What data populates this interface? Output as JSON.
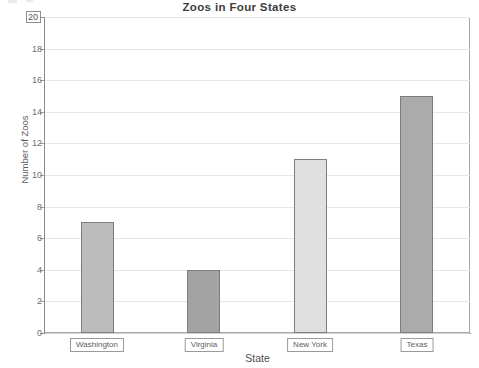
{
  "chart_data": {
    "type": "bar",
    "title": "Zoos in Four States",
    "xlabel": "State",
    "ylabel": "Number of Zoos",
    "categories": [
      "Washington",
      "Virginia",
      "New York",
      "Texas"
    ],
    "values": [
      7,
      4,
      11,
      15
    ],
    "ylim": [
      0,
      20
    ],
    "ytick_step": 2,
    "yticks": [
      0,
      2,
      4,
      6,
      8,
      10,
      12,
      14,
      16,
      18,
      20
    ],
    "ytick_labels": [
      "0",
      "2",
      "4",
      "6",
      "8",
      "10",
      "12",
      "14",
      "16",
      "18",
      "20"
    ],
    "xtick_labels_boxed": true,
    "ytick_top_label_boxed": true,
    "grid": "horizontal",
    "legend": "none",
    "bar_colors": [
      "#bcbcbc",
      "#a3a3a3",
      "#e0e0e0",
      "#ababab"
    ],
    "bar_edge_color": "#7d7d7d",
    "plot_background": "#ffffff",
    "frame_color": "#a8a8a8",
    "gridline_color": "#e6e6e6",
    "text_color": "#5a5a5a",
    "series": [
      {
        "name": "Number of Zoos",
        "points": [
          {
            "category": "Washington",
            "value": 7
          },
          {
            "category": "Virginia",
            "value": 4
          },
          {
            "category": "New York",
            "value": 11
          },
          {
            "category": "Texas",
            "value": 15
          }
        ]
      }
    ]
  }
}
